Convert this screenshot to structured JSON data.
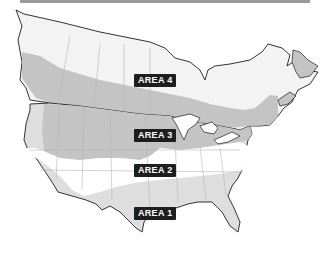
{
  "map": {
    "zones": [
      {
        "label": "AREA 4",
        "color": "#f3f3f3"
      },
      {
        "label": "AREA 3",
        "color": "#c4c4c4"
      },
      {
        "label": "AREA 2",
        "color": "#ffffff"
      },
      {
        "label": "AREA 1",
        "color": "#dedede"
      }
    ],
    "border_color": "#333333",
    "internal_border_color": "#b5b5b5"
  }
}
